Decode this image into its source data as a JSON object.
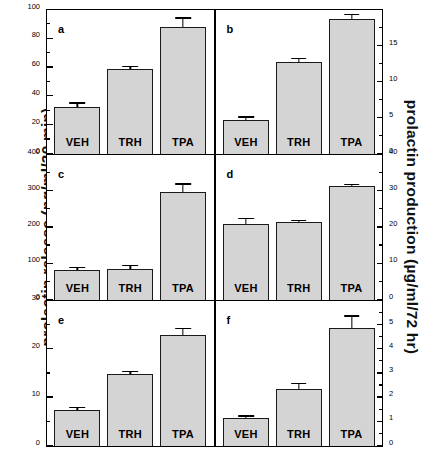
{
  "figure": {
    "ylabel_left": "prolactin  release  (ng/ml/30 min)",
    "ylabel_right": "prolactin production (µg/ml/72 hr)",
    "caption_partial": "",
    "bar_fill": "#d4d4d4",
    "bar_edge": "#1a1a1a",
    "background": "#ffffff"
  },
  "chart_data": [
    {
      "type": "bar",
      "panel": "a",
      "title": "",
      "xlabel": "",
      "ylabel": "prolactin  release  (ng/ml/30 min)",
      "axis_side": "left",
      "ylim": [
        0,
        100
      ],
      "yticks": [
        0,
        20,
        40,
        60,
        80,
        100
      ],
      "ytick_labels": [
        "0",
        "20",
        "40",
        "60",
        "80",
        "100"
      ],
      "minor_ticks": [
        10,
        30,
        50,
        70,
        90
      ],
      "grid": false,
      "legend": "none",
      "categories": [
        "VEH",
        "TRH",
        "TPA"
      ],
      "values": [
        32.5,
        59.0,
        88.0
      ],
      "errors": [
        2.5,
        1.5,
        6.0
      ]
    },
    {
      "type": "bar",
      "panel": "b",
      "title": "",
      "xlabel": "",
      "ylabel": "prolactin production (µg/ml/72 hr)",
      "axis_side": "right",
      "ylim": [
        0,
        20
      ],
      "yticks": [
        0,
        5,
        10,
        15
      ],
      "ytick_labels": [
        "0",
        "5",
        "10",
        "15"
      ],
      "minor_ticks": [
        2.5,
        7.5,
        12.5,
        17.5
      ],
      "grid": false,
      "legend": "none",
      "categories": [
        "VEH",
        "TRH",
        "TPA"
      ],
      "values": [
        4.7,
        12.8,
        18.7
      ],
      "errors": [
        0.35,
        0.4,
        0.55
      ]
    },
    {
      "type": "bar",
      "panel": "c",
      "title": "",
      "xlabel": "",
      "ylabel": "prolactin  release  (ng/ml/30 min)",
      "axis_side": "left",
      "ylim": [
        0,
        400
      ],
      "yticks": [
        0,
        100,
        200,
        300,
        400
      ],
      "ytick_labels": [
        "0",
        "100",
        "200",
        "300",
        "400"
      ],
      "minor_ticks": [
        50,
        150,
        250,
        350
      ],
      "grid": false,
      "legend": "none",
      "categories": [
        "VEH",
        "TRH",
        "TPA"
      ],
      "values": [
        83,
        86,
        298
      ],
      "errors": [
        4,
        7,
        20
      ]
    },
    {
      "type": "bar",
      "panel": "d",
      "title": "",
      "xlabel": "",
      "ylabel": "prolactin production (µg/ml/72 hr)",
      "axis_side": "right",
      "ylim": [
        0,
        40
      ],
      "yticks": [
        0,
        10,
        20,
        30,
        40
      ],
      "ytick_labels": [
        "0",
        "10",
        "20",
        "30",
        "40"
      ],
      "minor_ticks": [
        5,
        15,
        25,
        35
      ],
      "grid": false,
      "legend": "none",
      "categories": [
        "VEH",
        "TRH",
        "TPA"
      ],
      "values": [
        21.0,
        21.4,
        31.4
      ],
      "errors": [
        1.3,
        0.4,
        0.3
      ]
    },
    {
      "type": "bar",
      "panel": "e",
      "title": "",
      "xlabel": "",
      "ylabel": "prolactin  release  (ng/ml/30 min)",
      "axis_side": "left",
      "ylim": [
        0,
        30
      ],
      "yticks": [
        0,
        10,
        20,
        30
      ],
      "ytick_labels": [
        "0",
        "10",
        "20",
        "30"
      ],
      "minor_ticks": [
        5,
        15,
        25
      ],
      "grid": false,
      "legend": "none",
      "categories": [
        "VEH",
        "TRH",
        "TPA"
      ],
      "values": [
        7.5,
        15.0,
        23.0
      ],
      "errors": [
        0.3,
        0.3,
        1.2
      ]
    },
    {
      "type": "bar",
      "panel": "f",
      "title": "",
      "xlabel": "",
      "ylabel": "prolactin production (µg/ml/72 hr)",
      "axis_side": "right",
      "ylim": [
        0,
        6
      ],
      "yticks": [
        0,
        1,
        2,
        3,
        4,
        5
      ],
      "ytick_labels": [
        "0",
        "1",
        "2",
        "3",
        "4",
        "5"
      ],
      "minor_ticks": [
        0.5,
        1.5,
        2.5,
        3.5,
        4.5,
        5.5
      ],
      "grid": false,
      "legend": "none",
      "categories": [
        "VEH",
        "TRH",
        "TPA"
      ],
      "values": [
        1.15,
        2.35,
        4.9
      ],
      "errors": [
        0.06,
        0.2,
        0.45
      ]
    }
  ]
}
